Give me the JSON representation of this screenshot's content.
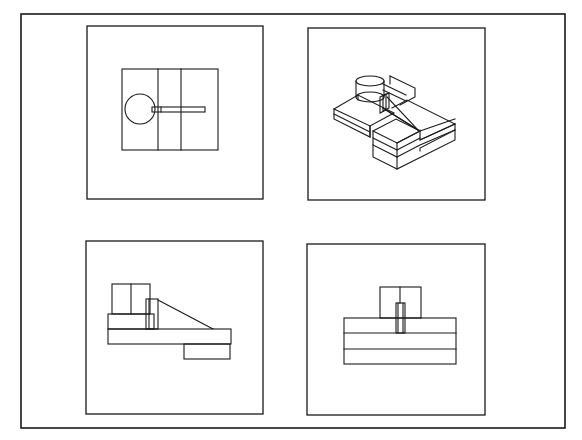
{
  "canvas": {
    "width": 582,
    "height": 440,
    "background": "#ffffff",
    "line_color": "#1a1a1a"
  },
  "sheet": {
    "border": {
      "x": 21,
      "y": 14,
      "w": 544,
      "h": 414
    }
  },
  "viewports": [
    {
      "id": "top-view",
      "label": "Plan (top) view",
      "box": {
        "x": 87,
        "y": 26,
        "w": 176,
        "h": 173
      },
      "rects": [
        {
          "x": 122,
          "y": 69,
          "w": 96,
          "h": 81
        },
        {
          "x": 152,
          "y": 107,
          "w": 53,
          "h": 5
        }
      ],
      "lines": [
        [
          158,
          69,
          158,
          150
        ],
        [
          181,
          69,
          181,
          150
        ],
        [
          161,
          107,
          161,
          112
        ]
      ],
      "circles": [
        {
          "cx": 140,
          "cy": 109,
          "r": 15
        }
      ]
    },
    {
      "id": "isometric-view",
      "label": "Isometric view",
      "box": {
        "x": 308,
        "y": 28,
        "w": 177,
        "h": 172
      },
      "polylines": [
        [
          [
            334,
            109
          ],
          [
            358,
            95
          ],
          [
            394,
            113
          ],
          [
            370,
            126
          ],
          [
            334,
            109
          ]
        ],
        [
          [
            334,
            109
          ],
          [
            334,
            119
          ],
          [
            370,
            137
          ],
          [
            370,
            126
          ]
        ],
        [
          [
            334,
            114
          ],
          [
            370,
            132
          ]
        ],
        [
          [
            370,
            126
          ],
          [
            370,
            137
          ]
        ],
        [
          [
            358,
            95
          ],
          [
            358,
            100
          ]
        ],
        [
          [
            392,
            108
          ],
          [
            407,
            100
          ],
          [
            455,
            124
          ],
          [
            455,
            130
          ],
          [
            420,
            148
          ],
          [
            420,
            151
          ]
        ],
        [
          [
            420,
            130
          ],
          [
            420,
            140
          ],
          [
            455,
            124
          ]
        ],
        [
          [
            420,
            140
          ],
          [
            455,
            124
          ]
        ],
        [
          [
            390,
            76
          ],
          [
            415,
            88
          ],
          [
            415,
            97
          ],
          [
            400,
            105
          ]
        ],
        [
          [
            390,
            76
          ],
          [
            390,
            84
          ]
        ],
        [
          [
            383,
            84
          ],
          [
            406,
            95
          ]
        ],
        [
          [
            383,
            90
          ],
          [
            406,
            101
          ]
        ],
        [
          [
            373,
            131
          ],
          [
            396,
            119
          ],
          [
            420,
            131
          ],
          [
            397,
            143
          ],
          [
            373,
            131
          ]
        ],
        [
          [
            373,
            131
          ],
          [
            373,
            145
          ],
          [
            397,
            157
          ],
          [
            397,
            143
          ]
        ],
        [
          [
            373,
            138
          ],
          [
            397,
            150
          ]
        ],
        [
          [
            397,
            143
          ],
          [
            420,
            131
          ],
          [
            455,
            119
          ]
        ],
        [
          [
            397,
            157
          ],
          [
            420,
            145
          ],
          [
            455,
            130
          ]
        ],
        [
          [
            397,
            150
          ],
          [
            420,
            138
          ]
        ],
        [
          [
            397,
            157
          ],
          [
            397,
            169
          ],
          [
            455,
            140
          ],
          [
            455,
            130
          ]
        ],
        [
          [
            373,
            145
          ],
          [
            373,
            157
          ],
          [
            397,
            169
          ]
        ],
        [
          [
            383,
            108
          ],
          [
            418,
            130
          ]
        ],
        [
          [
            386,
            110
          ],
          [
            418,
            130
          ]
        ],
        [
          [
            387,
            97
          ],
          [
            418,
            130
          ]
        ]
      ],
      "rects_iso": [
        {
          "pts": [
            [
              380,
              97
            ],
            [
              386,
              94
            ],
            [
              386,
              110
            ],
            [
              380,
              113
            ]
          ]
        },
        {
          "pts": [
            [
              383,
              96
            ],
            [
              389,
              93
            ],
            [
              389,
              108
            ],
            [
              383,
              111
            ]
          ]
        }
      ],
      "ellipses": [
        {
          "cx": 370,
          "cy": 81,
          "rx": 14,
          "ry": 5
        },
        {
          "cx": 370,
          "cy": 97,
          "rx": 14,
          "ry": 5
        }
      ],
      "cyl_sides": [
        [
          356,
          81,
          356,
          97
        ],
        [
          384,
          81,
          384,
          97
        ]
      ]
    },
    {
      "id": "front-view",
      "label": "Front elevation",
      "box": {
        "x": 86,
        "y": 241,
        "w": 177,
        "h": 173
      },
      "rects": [
        {
          "x": 112,
          "y": 284,
          "w": 38,
          "h": 30
        },
        {
          "x": 108,
          "y": 314,
          "w": 46,
          "h": 15
        },
        {
          "x": 146,
          "y": 299,
          "w": 12,
          "h": 30
        },
        {
          "x": 108,
          "y": 329,
          "w": 123,
          "h": 15
        },
        {
          "x": 184,
          "y": 344,
          "w": 46,
          "h": 15
        }
      ],
      "lines": [
        [
          131,
          284,
          131,
          314
        ],
        [
          149,
          299,
          149,
          329
        ],
        [
          158,
          300,
          213,
          329
        ]
      ]
    },
    {
      "id": "side-view",
      "label": "Side elevation",
      "box": {
        "x": 307,
        "y": 244,
        "w": 178,
        "h": 171
      },
      "rects": [
        {
          "x": 380,
          "y": 287,
          "w": 41,
          "h": 31
        },
        {
          "x": 396,
          "y": 303,
          "w": 9,
          "h": 30
        },
        {
          "x": 344,
          "y": 318,
          "w": 112,
          "h": 46
        }
      ],
      "lines": [
        [
          400,
          287,
          400,
          303
        ],
        [
          398,
          303,
          398,
          333
        ],
        [
          403,
          303,
          403,
          333
        ],
        [
          344,
          333,
          456,
          333
        ],
        [
          344,
          349,
          456,
          349
        ]
      ]
    }
  ]
}
